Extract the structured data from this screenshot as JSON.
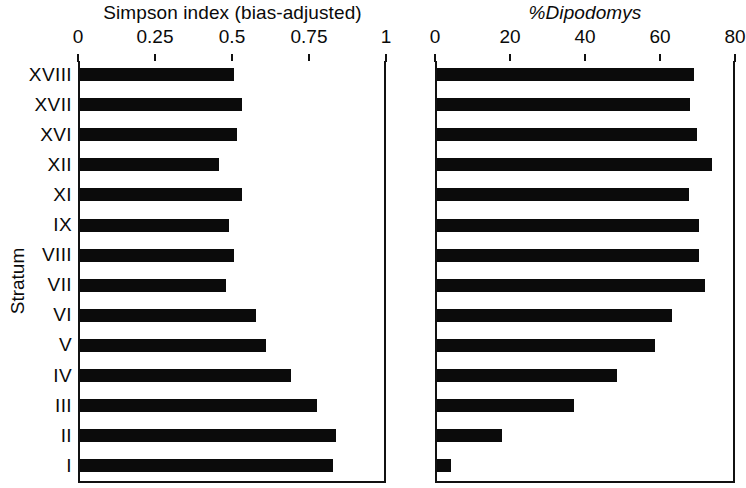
{
  "figure": {
    "background": "#ffffff",
    "bar_color": "#0b0b0b",
    "axis_color": "#111111",
    "y_axis_title": "Stratum"
  },
  "chart_data": [
    {
      "type": "bar",
      "orientation": "horizontal",
      "title": "Simpson index (bias-adjusted)",
      "xlabel": "Simpson index (bias-adjusted)",
      "ylabel": "Stratum",
      "xlim": [
        0,
        1
      ],
      "xticks": [
        0,
        0.25,
        0.5,
        0.75,
        1
      ],
      "xtick_labels": [
        "0",
        "0.25",
        "0.5",
        "0.75",
        "1"
      ],
      "grid": false,
      "legend": null,
      "categories": [
        "XVIII",
        "XVII",
        "XVI",
        "XII",
        "XI",
        "IX",
        "VIII",
        "VII",
        "VI",
        "V",
        "IV",
        "III",
        "II",
        "I"
      ],
      "values": [
        0.5,
        0.525,
        0.51,
        0.45,
        0.525,
        0.485,
        0.5,
        0.475,
        0.57,
        0.605,
        0.685,
        0.77,
        0.83,
        0.82
      ]
    },
    {
      "type": "bar",
      "orientation": "horizontal",
      "title": "%Dipodomys",
      "title_prefix": "%",
      "title_italic_part": "Dipodomys",
      "xlabel": "%Dipodomys",
      "ylabel": "Stratum",
      "xlim": [
        0,
        80
      ],
      "xticks": [
        0,
        20,
        40,
        60,
        80
      ],
      "xtick_labels": [
        "0",
        "20",
        "40",
        "60",
        "80"
      ],
      "grid": false,
      "legend": null,
      "categories": [
        "XVIII",
        "XVII",
        "XVI",
        "XII",
        "XI",
        "IX",
        "VIII",
        "VII",
        "VI",
        "V",
        "IV",
        "III",
        "II",
        "I"
      ],
      "values": [
        68.5,
        67.5,
        69.3,
        73.3,
        67.2,
        69.9,
        69.9,
        71.5,
        62.7,
        58.2,
        48.0,
        36.5,
        17.3,
        3.7
      ]
    }
  ]
}
